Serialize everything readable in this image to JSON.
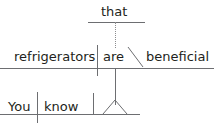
{
  "diagram": {
    "type": "reed-kellogg-sentence-diagram",
    "sentence": "You know that refrigerators are beneficial",
    "colors": {
      "text": "#231f20",
      "line": "#6d6e71",
      "dotted_line": "#8c8d8f",
      "background": "#ffffff"
    },
    "clauses": {
      "subordinate_upper": {
        "name": "relative-clause-marker",
        "words": [
          {
            "key": "that",
            "label": "that",
            "role": "relative-pronoun"
          }
        ]
      },
      "subordinate_main": {
        "name": "noun-clause",
        "words": [
          {
            "key": "refrigerators",
            "label": "refrigerators",
            "role": "subject"
          },
          {
            "key": "are",
            "label": "are",
            "role": "linking-verb"
          },
          {
            "key": "beneficial",
            "label": "beneficial",
            "role": "predicate-adjective"
          }
        ]
      },
      "independent": {
        "name": "main-clause",
        "words": [
          {
            "key": "you",
            "label": "You",
            "role": "subject"
          },
          {
            "key": "know",
            "label": "know",
            "role": "verb"
          }
        ]
      }
    },
    "connectors": {
      "dotted_vertical": "relative-pronoun-link",
      "solid_vertical": "noun-clause-to-direct-object-link",
      "pedestal": "triangle-pedestal"
    }
  }
}
